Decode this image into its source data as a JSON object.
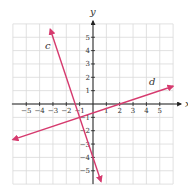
{
  "chart_data": {
    "type": "line",
    "title": "",
    "xlabel": "x",
    "ylabel": "y",
    "xlim": [
      -6,
      6
    ],
    "ylim": [
      -6,
      6
    ],
    "grid": true,
    "x_ticks": [
      -5,
      -4,
      -3,
      -2,
      -1,
      1,
      2,
      3,
      4,
      5
    ],
    "y_ticks": [
      -5,
      -4,
      -3,
      -2,
      -1,
      1,
      2,
      3,
      4,
      5
    ],
    "series": [
      {
        "name": "c",
        "equation": "y = -3x - 4",
        "points": [
          [
            -3.2,
            5.6
          ],
          [
            0.6,
            -5.8
          ]
        ]
      },
      {
        "name": "d",
        "equation": "y = (x - 2)/3",
        "points": [
          [
            -6,
            -2.67
          ],
          [
            6,
            1.33
          ]
        ]
      }
    ],
    "colors": {
      "line": "#d63a6e",
      "grid": "#d9d9d9",
      "axis": "#222222"
    }
  }
}
